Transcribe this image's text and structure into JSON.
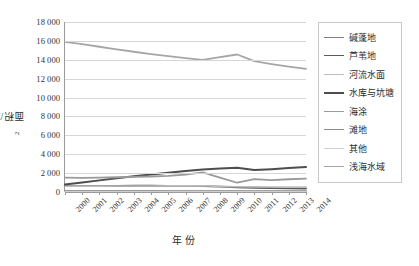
{
  "chart_data": {
    "type": "line",
    "title": "",
    "xlabel": "年份",
    "ylabel": "面积/km²",
    "ylabel_unit_base": "面积/km",
    "ylabel_unit_sup": "2",
    "categories": [
      "2000",
      "2001",
      "2002",
      "2003",
      "2004",
      "2005",
      "2006",
      "2007",
      "2008",
      "2009",
      "2010",
      "2011",
      "2012",
      "2013",
      "2014"
    ],
    "ylim": [
      0,
      18000
    ],
    "ytick_step": 2000,
    "yticks": [
      "0",
      "2 000",
      "4 000",
      "6 000",
      "8 000",
      "10 000",
      "12 000",
      "14 000",
      "16 000",
      "18 000"
    ],
    "ytick_values": [
      0,
      2000,
      4000,
      6000,
      8000,
      10000,
      12000,
      14000,
      16000,
      18000
    ],
    "grid": true,
    "legend_position": "right",
    "series": [
      {
        "name": "碱蓬地",
        "color": "#808080",
        "width": 1.6,
        "values": [
          120,
          120,
          120,
          120,
          120,
          115,
          110,
          105,
          100,
          100,
          95,
          95,
          90,
          90,
          90
        ]
      },
      {
        "name": "芦苇地",
        "color": "#5a5a5a",
        "width": 1.8,
        "values": [
          640,
          640,
          650,
          650,
          660,
          660,
          650,
          640,
          620,
          560,
          480,
          430,
          400,
          380,
          370
        ]
      },
      {
        "name": "河流水面",
        "color": "#bdbdbd",
        "width": 1.6,
        "values": [
          620,
          620,
          625,
          630,
          635,
          640,
          645,
          650,
          655,
          600,
          560,
          545,
          530,
          520,
          515
        ]
      },
      {
        "name": "水库与坑塘",
        "color": "#4d4d4d",
        "width": 2.0,
        "values": [
          800,
          1000,
          1230,
          1450,
          1660,
          1850,
          2030,
          2220,
          2380,
          2480,
          2560,
          2330,
          2420,
          2540,
          2650
        ]
      },
      {
        "name": "海涂",
        "color": "#9a9a9a",
        "width": 1.8,
        "values": [
          1520,
          1500,
          1530,
          1560,
          1600,
          1640,
          1700,
          1830,
          2080,
          1530,
          980,
          1360,
          1260,
          1350,
          1420
        ]
      },
      {
        "name": "滩地",
        "color": "#8c8c8c",
        "width": 1.6,
        "values": [
          110,
          110,
          110,
          110,
          110,
          108,
          105,
          100,
          95,
          90,
          85,
          85,
          80,
          80,
          80
        ]
      },
      {
        "name": "其他",
        "color": "#cfcfcf",
        "width": 1.6,
        "values": [
          60,
          60,
          60,
          60,
          60,
          58,
          55,
          52,
          50,
          48,
          45,
          45,
          42,
          40,
          40
        ]
      },
      {
        "name": "浅海水域",
        "color": "#a6a6a6",
        "width": 1.8,
        "values": [
          15900,
          15650,
          15380,
          15100,
          14850,
          14600,
          14380,
          14180,
          14000,
          14280,
          14560,
          13850,
          13550,
          13280,
          13030
        ]
      }
    ]
  }
}
